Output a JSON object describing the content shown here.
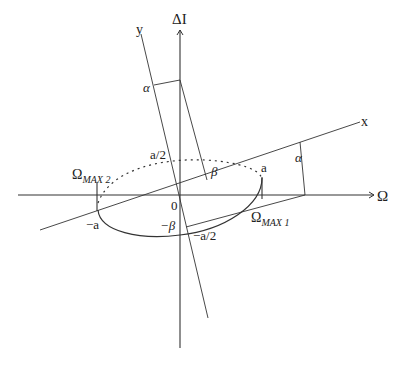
{
  "diagram": {
    "axes": {
      "horizontal_label": "Ω",
      "vertical_label": "ΔI",
      "rotated_x_label": "x",
      "rotated_y_label": "y"
    },
    "labels": {
      "origin": "0",
      "a_pos": "a",
      "a_neg": "−a",
      "a_half_pos": "a/2",
      "a_half_neg": "−a/2",
      "alpha_top": "α",
      "alpha_right": "α",
      "beta_pos": "β",
      "beta_neg": "−β",
      "omega_max2_base": "Ω",
      "omega_max2_sub": "MAX 2",
      "omega_max1_base": "Ω",
      "omega_max1_sub": "MAX 1"
    },
    "colors": {
      "line": "#333333",
      "background": "#ffffff"
    }
  }
}
